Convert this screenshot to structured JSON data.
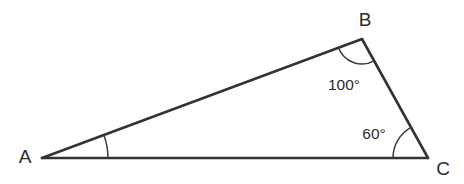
{
  "figure": {
    "type": "triangle-diagram",
    "background_color": "#ffffff",
    "stroke_color": "#333333",
    "text_color": "#2b2b2b",
    "width": 464,
    "height": 184
  },
  "vertices": {
    "a": {
      "label": "A",
      "x": 42,
      "y": 158,
      "label_x": 25,
      "label_y": 158
    },
    "b": {
      "label": "B",
      "x": 362,
      "y": 39,
      "label_x": 365,
      "label_y": 21
    },
    "c": {
      "label": "C",
      "x": 428,
      "y": 158,
      "label_x": 443,
      "label_y": 170
    }
  },
  "angles": {
    "a": {
      "value": "",
      "label_x": 0,
      "label_y": 0,
      "arc_radius": 66
    },
    "b": {
      "value": "100°",
      "label_x": 344,
      "label_y": 86,
      "arc_radius": 25
    },
    "c": {
      "value": "60°",
      "label_x": 374,
      "label_y": 135,
      "arc_radius": 35
    }
  },
  "edges": {
    "ab": "A–B",
    "bc": "B–C",
    "ca": "C–A"
  }
}
